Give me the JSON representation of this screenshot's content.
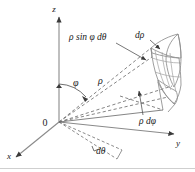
{
  "figure": {
    "background_color": "#ffffff",
    "width": 195,
    "height": 172
  },
  "axes": {
    "z": {
      "label": "z",
      "x": 54,
      "y": 12
    },
    "y": {
      "label": "y",
      "x": 178,
      "y": 146
    },
    "x": {
      "label": "x",
      "x": 9,
      "y": 159
    },
    "origin": {
      "label": "0",
      "x": 45,
      "y": 126
    },
    "color": "#8a8a8a"
  },
  "labels": {
    "rho_sin_phi_dtheta": {
      "text": "ρ sin φ dθ",
      "x": 69,
      "y": 40
    },
    "d_rho": {
      "text": "dρ",
      "x": 135,
      "y": 38
    },
    "rho_d_phi": {
      "text": "ρ dφ",
      "x": 139,
      "y": 124
    },
    "d_theta": {
      "text": "dθ",
      "x": 96,
      "y": 154
    },
    "phi": {
      "text": "φ",
      "x": 73,
      "y": 86
    },
    "rho": {
      "text": "ρ",
      "x": 98,
      "y": 84
    }
  },
  "colors": {
    "line": "#6f6f6f",
    "axis": "#8a8a8a",
    "text": "#1a1a1a",
    "solid_edge": "#8c8c8c",
    "rule": "#a0a0a0"
  }
}
